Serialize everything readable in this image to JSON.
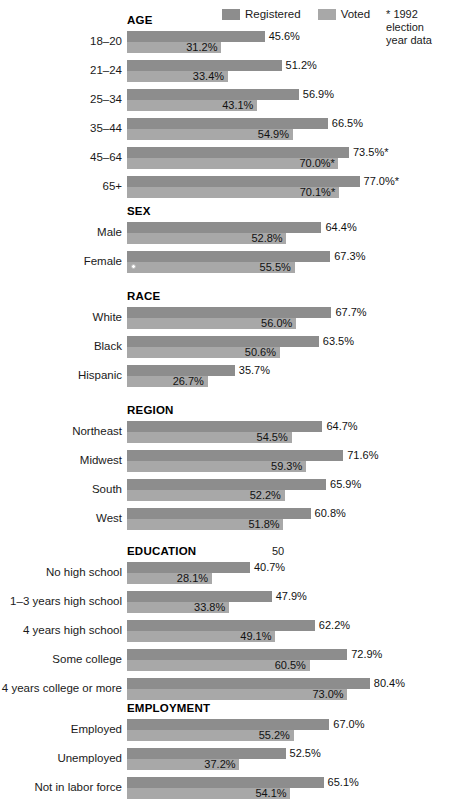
{
  "legend": {
    "registered_label": "Registered",
    "voted_label": "Voted",
    "note": "* 1992 election\nyear data",
    "registered_color": "#8d8d8d",
    "voted_color": "#a8a8a8"
  },
  "axis": {
    "tick_label": "50",
    "tick_value": 50,
    "min": 0,
    "max": 100,
    "px_per_percent": 3.02,
    "origin_x": 127
  },
  "chart_data": {
    "type": "bar",
    "title": "",
    "xlabel": "",
    "ylabel": "",
    "orientation": "horizontal",
    "xlim": [
      0,
      100
    ],
    "grid": false,
    "legend_position": "top-right",
    "units": "percent",
    "series": [
      {
        "name": "Registered",
        "color": "#8d8d8d"
      },
      {
        "name": "Voted",
        "color": "#a8a8a8"
      }
    ],
    "groups": [
      {
        "name": "AGE",
        "rows": [
          {
            "label": "18–20",
            "registered": 45.6,
            "voted": 31.2,
            "registered_text": "45.6%",
            "voted_text": "31.2%"
          },
          {
            "label": "21–24",
            "registered": 51.2,
            "voted": 33.4,
            "registered_text": "51.2%",
            "voted_text": "33.4%"
          },
          {
            "label": "25–34",
            "registered": 56.9,
            "voted": 43.1,
            "registered_text": "56.9%",
            "voted_text": "43.1%"
          },
          {
            "label": "35–44",
            "registered": 66.5,
            "voted": 54.9,
            "registered_text": "66.5%",
            "voted_text": "54.9%"
          },
          {
            "label": "45–64",
            "registered": 73.5,
            "voted": 70.0,
            "registered_text": "73.5%*",
            "voted_text": "70.0%*"
          },
          {
            "label": "65+",
            "registered": 77.0,
            "voted": 70.1,
            "registered_text": "77.0%*",
            "voted_text": "70.1%*"
          }
        ]
      },
      {
        "name": "SEX",
        "rows": [
          {
            "label": "Male",
            "registered": 64.4,
            "voted": 52.8,
            "registered_text": "64.4%",
            "voted_text": "52.8%"
          },
          {
            "label": "Female",
            "registered": 67.3,
            "voted": 55.5,
            "registered_text": "67.3%",
            "voted_text": "55.5%"
          }
        ]
      },
      {
        "name": "RACE",
        "rows": [
          {
            "label": "White",
            "registered": 67.7,
            "voted": 56.0,
            "registered_text": "67.7%",
            "voted_text": "56.0%"
          },
          {
            "label": "Black",
            "registered": 63.5,
            "voted": 50.6,
            "registered_text": "63.5%",
            "voted_text": "50.6%"
          },
          {
            "label": "Hispanic",
            "registered": 35.7,
            "voted": 26.7,
            "registered_text": "35.7%",
            "voted_text": "26.7%"
          }
        ]
      },
      {
        "name": "REGION",
        "rows": [
          {
            "label": "Northeast",
            "registered": 64.7,
            "voted": 54.5,
            "registered_text": "64.7%",
            "voted_text": "54.5%"
          },
          {
            "label": "Midwest",
            "registered": 71.6,
            "voted": 59.3,
            "registered_text": "71.6%",
            "voted_text": "59.3%"
          },
          {
            "label": "South",
            "registered": 65.9,
            "voted": 52.2,
            "registered_text": "65.9%",
            "voted_text": "52.2%"
          },
          {
            "label": "West",
            "registered": 60.8,
            "voted": 51.8,
            "registered_text": "60.8%",
            "voted_text": "51.8%"
          }
        ]
      },
      {
        "name": "EDUCATION",
        "rows": [
          {
            "label": "No high school",
            "registered": 40.7,
            "voted": 28.1,
            "registered_text": "40.7%",
            "voted_text": "28.1%"
          },
          {
            "label": "1–3 years high school",
            "registered": 47.9,
            "voted": 33.8,
            "registered_text": "47.9%",
            "voted_text": "33.8%"
          },
          {
            "label": "4 years high school",
            "registered": 62.2,
            "voted": 49.1,
            "registered_text": "62.2%",
            "voted_text": "49.1%"
          },
          {
            "label": "Some college",
            "registered": 72.9,
            "voted": 60.5,
            "registered_text": "72.9%",
            "voted_text": "60.5%"
          },
          {
            "label": "4 years college or more",
            "registered": 80.4,
            "voted": 73.0,
            "registered_text": "80.4%",
            "voted_text": "73.0%"
          }
        ]
      },
      {
        "name": "EMPLOYMENT",
        "rows": [
          {
            "label": "Employed",
            "registered": 67.0,
            "voted": 55.2,
            "registered_text": "67.0%",
            "voted_text": "55.2%"
          },
          {
            "label": "Unemployed",
            "registered": 52.5,
            "voted": 37.2,
            "registered_text": "52.5%",
            "voted_text": "37.2%"
          },
          {
            "label": "Not in labor force",
            "registered": 65.1,
            "voted": 54.1,
            "registered_text": "65.1%",
            "voted_text": "54.1%"
          }
        ]
      }
    ]
  }
}
